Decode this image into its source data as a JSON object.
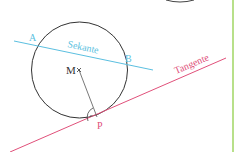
{
  "diagram": {
    "labels": {
      "A": "A",
      "B": "B",
      "M": "M",
      "P": "P",
      "secant": "Sekante",
      "tangent": "Tangente"
    },
    "colors": {
      "circle": "#333333",
      "secant": "#5bbfe0",
      "tangent": "#e0507a",
      "radius": "#555555",
      "border": "#b8e08a"
    }
  }
}
